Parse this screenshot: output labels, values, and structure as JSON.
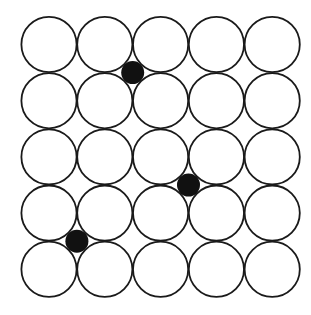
{
  "diagram": {
    "grid": {
      "rows": 5,
      "cols": 5,
      "origin_x": 49.0,
      "origin_y": 44.5,
      "spacing_x": 55.8,
      "spacing_y": 56.2,
      "radius": 27.6,
      "stroke": "#1a1a1a",
      "fill": "#ffffff"
    },
    "interstitials": [
      {
        "between_cols": [
          1,
          2
        ],
        "between_rows": [
          0,
          1
        ]
      },
      {
        "between_cols": [
          2,
          3
        ],
        "between_rows": [
          2,
          3
        ]
      },
      {
        "between_cols": [
          0,
          1
        ],
        "between_rows": [
          3,
          4
        ]
      }
    ],
    "dot": {
      "radius": 11.5,
      "fill": "#111111"
    }
  }
}
